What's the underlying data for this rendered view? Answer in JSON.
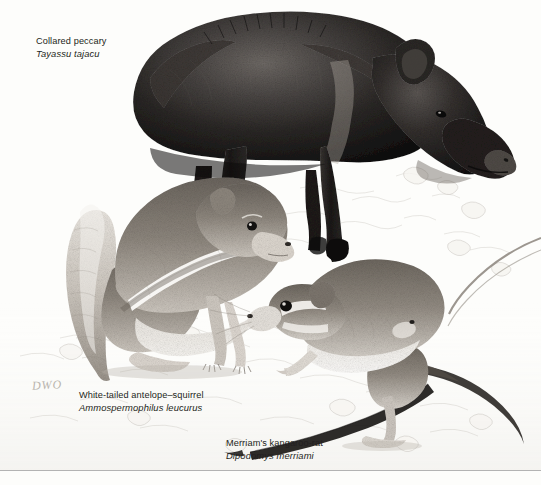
{
  "plate": {
    "title": "Sonoran Desert mammals illustration plate",
    "background_color": "#fdfdfb",
    "ink_color": "#231f20",
    "rule_color": "#b3b3b3",
    "medium": "graphite / stipple pencil drawing"
  },
  "signature": {
    "text": "DWO"
  },
  "specimens": [
    {
      "id": "collared-peccary",
      "common_name": "Collared peccary",
      "scientific_name": "Tayassu tajacu"
    },
    {
      "id": "white-tailed-antelope-squirrel",
      "common_name": "White-tailed antelope–squirrel",
      "scientific_name": "Ammospermophilus leucurus"
    },
    {
      "id": "merriams-kangaroo-rat",
      "common_name": "Merriam's kangaroo-rat",
      "scientific_name": "Dipodomys merriami"
    }
  ]
}
